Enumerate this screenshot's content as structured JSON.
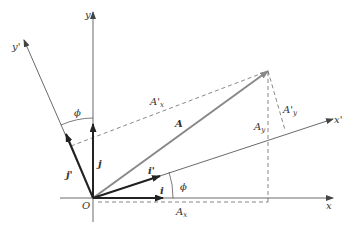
{
  "diagram": {
    "type": "coordinate-rotation",
    "colors": {
      "axis": "#444444",
      "unit_vector": "#222222",
      "vector_A": "#888888",
      "dashed": "#555555",
      "background": "#ffffff"
    },
    "labels": {
      "origin": "O",
      "x_axis": "x",
      "y_axis": "y",
      "x_prime_axis": "x'",
      "y_prime_axis": "y'",
      "vector_A": "A",
      "unit_i": "i",
      "unit_j": "j",
      "unit_i_prime": "i'",
      "unit_j_prime": "j'",
      "A_x_main": "A",
      "A_x_sub": "x",
      "A_y_main": "A",
      "A_y_sub": "y",
      "A_x_prime_main": "A'",
      "A_x_prime_sub": "x",
      "A_y_prime_main": "A'",
      "A_y_prime_sub": "y",
      "angle_upper": "ϕ",
      "angle_lower": "ϕ"
    }
  }
}
